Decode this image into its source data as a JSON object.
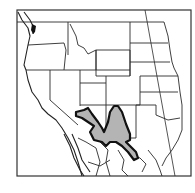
{
  "map": {
    "region": "Western United States and northern Mexico",
    "legend_label": "Species range",
    "colors": {
      "background": "#ffffff",
      "border": "#2a2a2a",
      "range_fill": "#b4b4b4",
      "range_outline": "#111111"
    },
    "range_areas": [
      {
        "name": "Arizona-New Mexico range",
        "description": "Shaded distribution across central Arizona and New Mexico extending into northern Mexico"
      }
    ]
  }
}
